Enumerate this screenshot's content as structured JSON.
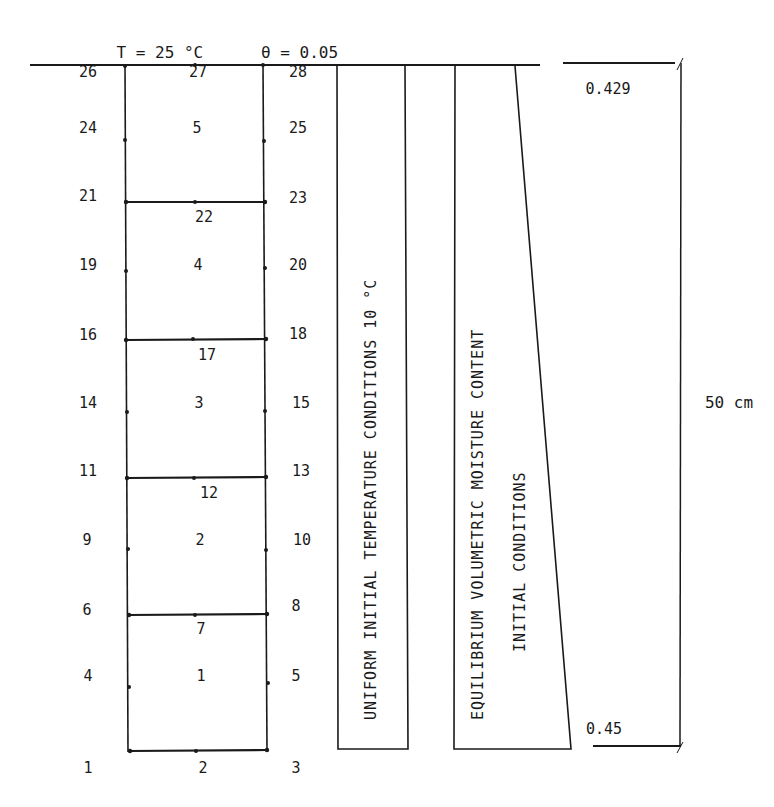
{
  "header": {
    "temperature": "T = 25 °C",
    "moisture": "θ = 0.05"
  },
  "grid": {
    "left_column_nodes": [
      {
        "label": "26",
        "y": 72
      },
      {
        "label": "24",
        "y": 128
      },
      {
        "label": "21",
        "y": 196
      },
      {
        "label": "19",
        "y": 265
      },
      {
        "label": "16",
        "y": 335
      },
      {
        "label": "14",
        "y": 403
      },
      {
        "label": "11",
        "y": 471
      },
      {
        "label": "9",
        "y": 540
      },
      {
        "label": "6",
        "y": 610
      },
      {
        "label": "4",
        "y": 676
      },
      {
        "label": "1",
        "y": 768
      }
    ],
    "center_column_nodes": [
      {
        "label": "27",
        "y": 72
      },
      {
        "label": "5",
        "y": 128
      },
      {
        "label": "22",
        "y": 217
      },
      {
        "label": "4",
        "y": 265
      },
      {
        "label": "17",
        "y": 355
      },
      {
        "label": "3",
        "y": 403
      },
      {
        "label": "12",
        "y": 493
      },
      {
        "label": "2",
        "y": 540
      },
      {
        "label": "7",
        "y": 629
      },
      {
        "label": "1",
        "y": 676
      },
      {
        "label": "2",
        "y": 768
      }
    ],
    "right_column_nodes": [
      {
        "label": "28",
        "y": 72
      },
      {
        "label": "25",
        "y": 128
      },
      {
        "label": "23",
        "y": 198
      },
      {
        "label": "20",
        "y": 265
      },
      {
        "label": "18",
        "y": 334
      },
      {
        "label": "15",
        "y": 403
      },
      {
        "label": "13",
        "y": 471
      },
      {
        "label": "10",
        "y": 540
      },
      {
        "label": "8",
        "y": 606
      },
      {
        "label": "5",
        "y": 676
      },
      {
        "label": "3",
        "y": 768
      }
    ],
    "element_boundaries_y": [
      65,
      202,
      340,
      478,
      615,
      752
    ]
  },
  "boxes": {
    "temperature_box_text": "UNIFORM INITIAL TEMPERATURE CONDITIONS 10 °C",
    "moisture_box_line1": "EQUILIBRIUM VOLUMETRIC MOISTURE CONTENT",
    "moisture_box_line2": "INITIAL CONDITIONS"
  },
  "annotations": {
    "top_moisture_value": "0.429",
    "bottom_moisture_value": "0.45",
    "depth_dimension": "50 cm"
  },
  "colors": {
    "ink": "#1a1a1a",
    "background": "#ffffff"
  }
}
